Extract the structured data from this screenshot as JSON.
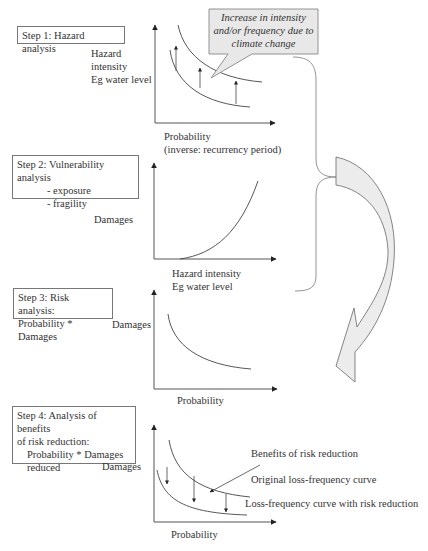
{
  "diagram": {
    "steps": [
      {
        "id": 1,
        "box_lines": [
          "Step 1: Hazard analysis"
        ],
        "y_axis_label_lines": [
          "Hazard",
          "intensity",
          "Eg water level"
        ],
        "x_axis_label_lines": [
          "Probability",
          "(inverse: recurrency period)"
        ],
        "callout_lines": [
          "Increase in intensity",
          "and/or frequency due to",
          "climate change"
        ]
      },
      {
        "id": 2,
        "box_lines": [
          "Step 2: Vulnerability analysis",
          "- exposure",
          "- fragility"
        ],
        "y_axis_label_lines": [
          "Damages"
        ],
        "x_axis_label_lines": [
          "Hazard intensity",
          "Eg water level"
        ]
      },
      {
        "id": 3,
        "box_lines": [
          "Step 3: Risk analysis:",
          "Probability * Damages"
        ],
        "y_axis_label_lines": [
          "Damages"
        ],
        "x_axis_label_lines": [
          "Probability"
        ]
      },
      {
        "id": 4,
        "box_lines": [
          "Step 4: Analysis of benefits",
          "of risk reduction:",
          "Probability * Damages",
          "reduced"
        ],
        "y_axis_label_lines": [
          "Damages"
        ],
        "x_axis_label_lines": [
          "Probability"
        ],
        "annotations": [
          "Benefits of risk reduction",
          "Original loss-frequency curve",
          "Loss-frequency curve with risk reduction"
        ]
      }
    ],
    "colors": {
      "line": "#444444",
      "box_border": "#777777",
      "callout_fill": "#e8e8e8",
      "arrow_fill": "#eeeeee",
      "text": "#333333"
    }
  }
}
